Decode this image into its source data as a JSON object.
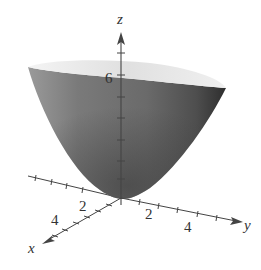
{
  "figure": {
    "surface": "elliptic paraboloid",
    "colors": {
      "surface_outer": "#6e6e6e",
      "surface_inner": "#d4d4d4",
      "axis": "#444444",
      "background": "#ffffff"
    },
    "axes": {
      "x": {
        "label": "x",
        "ticks": [
          "2",
          "4"
        ]
      },
      "y": {
        "label": "y",
        "ticks": [
          "2",
          "4"
        ]
      },
      "z": {
        "label": "z",
        "ticks": [
          "6"
        ]
      }
    }
  }
}
